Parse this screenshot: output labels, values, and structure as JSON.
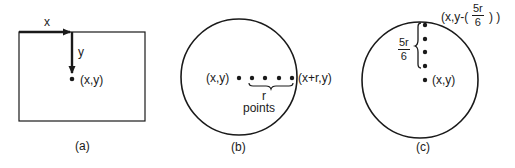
{
  "colors": {
    "ink": "#1a1a1a",
    "background": "#ffffff"
  },
  "panels": [
    {
      "id": "a",
      "caption": "(a)",
      "shape": "rectangle",
      "axis_x_label": "x",
      "axis_y_label": "y",
      "point_label": "(x,y)"
    },
    {
      "id": "b",
      "caption": "(b)",
      "shape": "circle",
      "center_label": "(x,y)",
      "edge_label": "(x+r,y)",
      "brace_label_line1": "r",
      "brace_label_line2": "points",
      "point_count": 5
    },
    {
      "id": "c",
      "caption": "(c)",
      "shape": "circle",
      "center_label": "(x,y)",
      "top_label_prefix": "(x,y-(",
      "top_label_suffix": ") )",
      "top_frac_num": "5r",
      "top_frac_den": "6",
      "brace_frac_num": "5r",
      "brace_frac_den": "6",
      "point_count": 5
    }
  ]
}
